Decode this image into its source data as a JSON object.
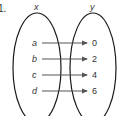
{
  "problem": {
    "number": "1."
  },
  "domain_set": {
    "title": "x",
    "elements": [
      "a",
      "b",
      "c",
      "d"
    ]
  },
  "range_set": {
    "title": "y",
    "elements": [
      "0",
      "2",
      "4",
      "6"
    ]
  },
  "mappings": [
    {
      "from": "a",
      "to": "0"
    },
    {
      "from": "b",
      "to": "2"
    },
    {
      "from": "c",
      "to": "4"
    },
    {
      "from": "d",
      "to": "6"
    }
  ],
  "colors": {
    "stroke": "#1a1a1a",
    "arrow": "#555555",
    "text": "#333333"
  }
}
